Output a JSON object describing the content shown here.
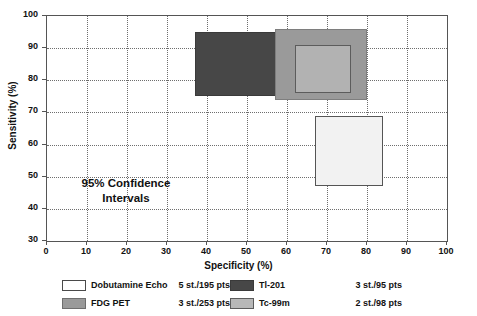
{
  "chart_data": {
    "type": "bar",
    "title": "",
    "xlabel": "Specificity (%)",
    "ylabel": "Sensitivity (%)",
    "xlim": [
      0,
      100
    ],
    "ylim": [
      30,
      100
    ],
    "xticks": [
      0,
      10,
      20,
      30,
      40,
      50,
      60,
      70,
      80,
      90,
      100
    ],
    "yticks": [
      30,
      40,
      50,
      60,
      70,
      80,
      90,
      100
    ],
    "grid": true,
    "legend_position": "below",
    "annotation": {
      "line1": "95% Confidence",
      "line2": "Intervals",
      "x": 15,
      "y": 43
    },
    "boxes": [
      {
        "name": "Tl-201",
        "x_low": 37,
        "x_high": 71,
        "y_low": 75,
        "y_high": 95,
        "color": "#474747",
        "border": "#3a3a3a",
        "studies": "3 st./95 pts"
      },
      {
        "name": "FDG PET",
        "x_low": 57,
        "x_high": 80,
        "y_low": 74,
        "y_high": 96,
        "color": "#9a9a9a",
        "border": "#7e7e7e",
        "studies": "3 st./253 pts"
      },
      {
        "name": "Tc-99m",
        "x_low": 62,
        "x_high": 76,
        "y_low": 76,
        "y_high": 91,
        "color": "#b2b2b2",
        "border": "#5c5c5c",
        "studies": "2 st./98 pts"
      },
      {
        "name": "Dobutamine Echo",
        "x_low": 67,
        "x_high": 84,
        "y_low": 47,
        "y_high": 69,
        "color": "#f2f2f2",
        "border": "#555555",
        "studies": "5 st./195 pts"
      }
    ]
  },
  "legend": {
    "entries": [
      {
        "label": "Dobutamine Echo",
        "stats": "5 st./195 pts",
        "color": "#ffffff",
        "border": "#4a4a4a"
      },
      {
        "label": "Tl-201",
        "stats": "3 st./95 pts",
        "color": "#474747",
        "border": "#3a3a3a"
      },
      {
        "label": "FDG PET",
        "stats": "3 st./253 pts",
        "color": "#9a9a9a",
        "border": "#6e6e6e"
      },
      {
        "label": "Tc-99m",
        "stats": "2 st./98 pts",
        "color": "#b8b8b8",
        "border": "#5c5c5c"
      }
    ]
  },
  "axes": {
    "x_tick_labels": [
      "0",
      "10",
      "20",
      "30",
      "40",
      "50",
      "60",
      "70",
      "80",
      "90",
      "100"
    ],
    "y_tick_labels": [
      "100",
      "90",
      "80",
      "70",
      "60",
      "50",
      "40",
      "30"
    ]
  }
}
